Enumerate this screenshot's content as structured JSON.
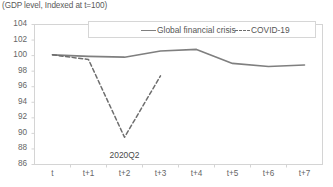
{
  "chart_data": {
    "type": "line",
    "title": "(GDP level, Indexed at t=100)",
    "xlabel": "",
    "ylabel": "",
    "ylim": [
      86,
      104
    ],
    "ytick_step": 2,
    "yticks": [
      104,
      102,
      100,
      98,
      96,
      94,
      92,
      90,
      88,
      86
    ],
    "categories": [
      "t",
      "t+1",
      "t+2",
      "t+3",
      "t+4",
      "t+5",
      "t+6",
      "t+7"
    ],
    "grid": false,
    "legend_position": "top",
    "series": [
      {
        "name": "Global financial crisis",
        "style": "solid",
        "color": "#7f7f7f",
        "values": [
          100.1,
          99.9,
          99.8,
          100.6,
          100.8,
          99.0,
          98.6,
          98.8
        ]
      },
      {
        "name": "COVID-19",
        "style": "dashed",
        "color": "#6e6e6e",
        "values": [
          100.1,
          99.5,
          89.5,
          97.4,
          null,
          null,
          null,
          null
        ]
      }
    ],
    "annotations": [
      {
        "text": "2020Q2",
        "x_category": "t+2",
        "value": 88.0
      }
    ]
  },
  "legend": {
    "items": [
      {
        "label": "Global financial crisis",
        "swatch": "solid-line-swatch"
      },
      {
        "label": "COVID-19",
        "swatch": "dashed-line-swatch"
      }
    ]
  }
}
